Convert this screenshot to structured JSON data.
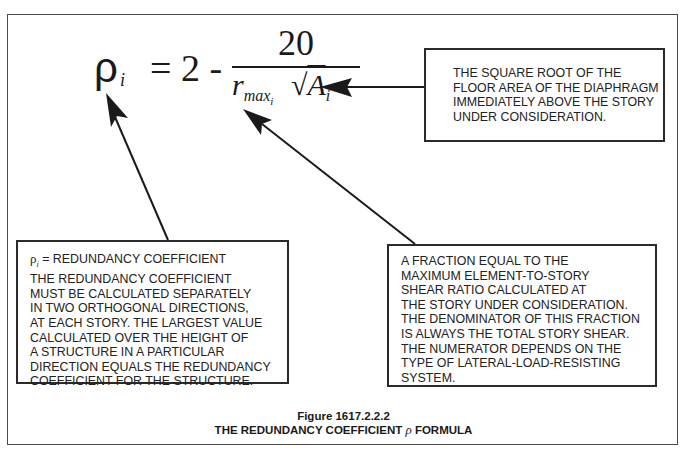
{
  "formula": {
    "lhs_symbol": "ρ",
    "lhs_subscript": "i",
    "equals_part": "= 2 -",
    "numerator": "20",
    "denominator_r": "r",
    "denominator_r_subscript": "max",
    "denominator_r_subsubscript": "i",
    "denominator_sqrt": "√",
    "denominator_a": "A",
    "denominator_a_subscript": "i"
  },
  "callouts": {
    "sqrt_area": {
      "lines": [
        "THE SQUARE ROOT OF THE",
        "FLOOR AREA OF THE DIAPHRAGM",
        "IMMEDIATELY ABOVE THE STORY",
        "UNDER CONSIDERATION."
      ]
    },
    "redundancy_coefficient": {
      "rho_symbol": "ρ",
      "rho_subscript": "i",
      "first_line_rest": " = REDUNDANCY COEFFICIENT",
      "lines": [
        "THE REDUNDANCY COEFFICIENT",
        "MUST BE CALCULATED SEPARATELY",
        "IN TWO ORTHOGONAL DIRECTIONS,",
        "AT EACH STORY. THE LARGEST VALUE",
        "CALCULATED OVER THE HEIGHT OF",
        "A STRUCTURE IN A PARTICULAR",
        "DIRECTION EQUALS THE REDUNDANCY",
        "COEFFICIENT FOR THE STRUCTURE."
      ]
    },
    "rmax_fraction": {
      "lines": [
        "A FRACTION EQUAL TO THE",
        "MAXIMUM ELEMENT-TO-STORY",
        "SHEAR RATIO CALCULATED AT",
        "THE STORY UNDER CONSIDERATION.",
        "THE DENOMINATOR OF THIS FRACTION",
        "IS ALWAYS THE TOTAL STORY SHEAR.",
        "THE NUMERATOR DEPENDS ON THE",
        "TYPE OF LATERAL-LOAD-RESISTING",
        "SYSTEM."
      ]
    }
  },
  "caption": {
    "figure_number": "Figure 1617.2.2.2",
    "title_before": "THE REDUNDANCY COEFFICIENT ",
    "title_symbol": "ρ",
    "title_after": " FORMULA"
  },
  "colors": {
    "ink": "#1a1a1a",
    "border": "#2a2a2a",
    "background": "#ffffff"
  }
}
